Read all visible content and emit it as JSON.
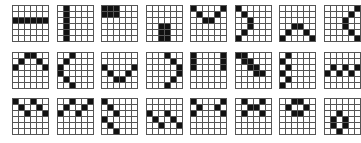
{
  "layout": {
    "rows": 3,
    "cols": 8,
    "grid_size": 6,
    "origin_x": 12,
    "origin_y": 5,
    "pitch_x": 44.5,
    "pitch_y": 46.5
  },
  "colors": {
    "on": "#111111",
    "off": "#ffffff",
    "line": "#555555"
  },
  "patterns": [
    [
      "000000",
      "000000",
      "111111",
      "000000",
      "000000",
      "000000"
    ],
    [
      "010000",
      "010000",
      "010000",
      "010000",
      "010000",
      "010000"
    ],
    [
      "111000",
      "111000",
      "000000",
      "000000",
      "000000",
      "000000"
    ],
    [
      "000000",
      "000000",
      "000000",
      "001100",
      "001100",
      "001100"
    ],
    [
      "100001",
      "010010",
      "001100",
      "000000",
      "000000",
      "000000"
    ],
    [
      "100000",
      "010000",
      "001000",
      "001000",
      "010000",
      "100000"
    ],
    [
      "000000",
      "000000",
      "000000",
      "001100",
      "010010",
      "100001"
    ],
    [
      "000001",
      "000010",
      "000100",
      "000100",
      "000010",
      "000001"
    ],
    [
      "001100",
      "010010",
      "100001",
      "000000",
      "000000",
      "000000"
    ],
    [
      "001000",
      "010000",
      "100000",
      "100000",
      "010000",
      "001000"
    ],
    [
      "000000",
      "000000",
      "100001",
      "010010",
      "001100",
      "000000"
    ],
    [
      "000100",
      "000010",
      "000001",
      "000001",
      "000010",
      "000100"
    ],
    [
      "100001",
      "100001",
      "100001",
      "000000",
      "000000",
      "000000"
    ],
    [
      "110000",
      "011000",
      "001100",
      "000110",
      "000000",
      "000000"
    ],
    [
      "010000",
      "100000",
      "010000",
      "100000",
      "010000",
      "100000"
    ],
    [
      "000000",
      "000000",
      "010101",
      "101010",
      "000000",
      "000000"
    ],
    [
      "100100",
      "010010",
      "001001",
      "000000",
      "000000",
      "000000"
    ],
    [
      "001001",
      "010010",
      "100100",
      "000000",
      "000000",
      "000000"
    ],
    [
      "100000",
      "010000",
      "001000",
      "100000",
      "010000",
      "001000"
    ],
    [
      "000000",
      "000000",
      "100100",
      "010010",
      "001001",
      "000000"
    ],
    [
      "100001",
      "010010",
      "100001",
      "000000",
      "000000",
      "000000"
    ],
    [
      "010010",
      "001100",
      "010010",
      "000000",
      "000000",
      "000000"
    ],
    [
      "001100",
      "010010",
      "001100",
      "000000",
      "000000",
      "000000"
    ],
    [
      "000000",
      "000000",
      "001000",
      "010100",
      "010100",
      "001000"
    ]
  ]
}
